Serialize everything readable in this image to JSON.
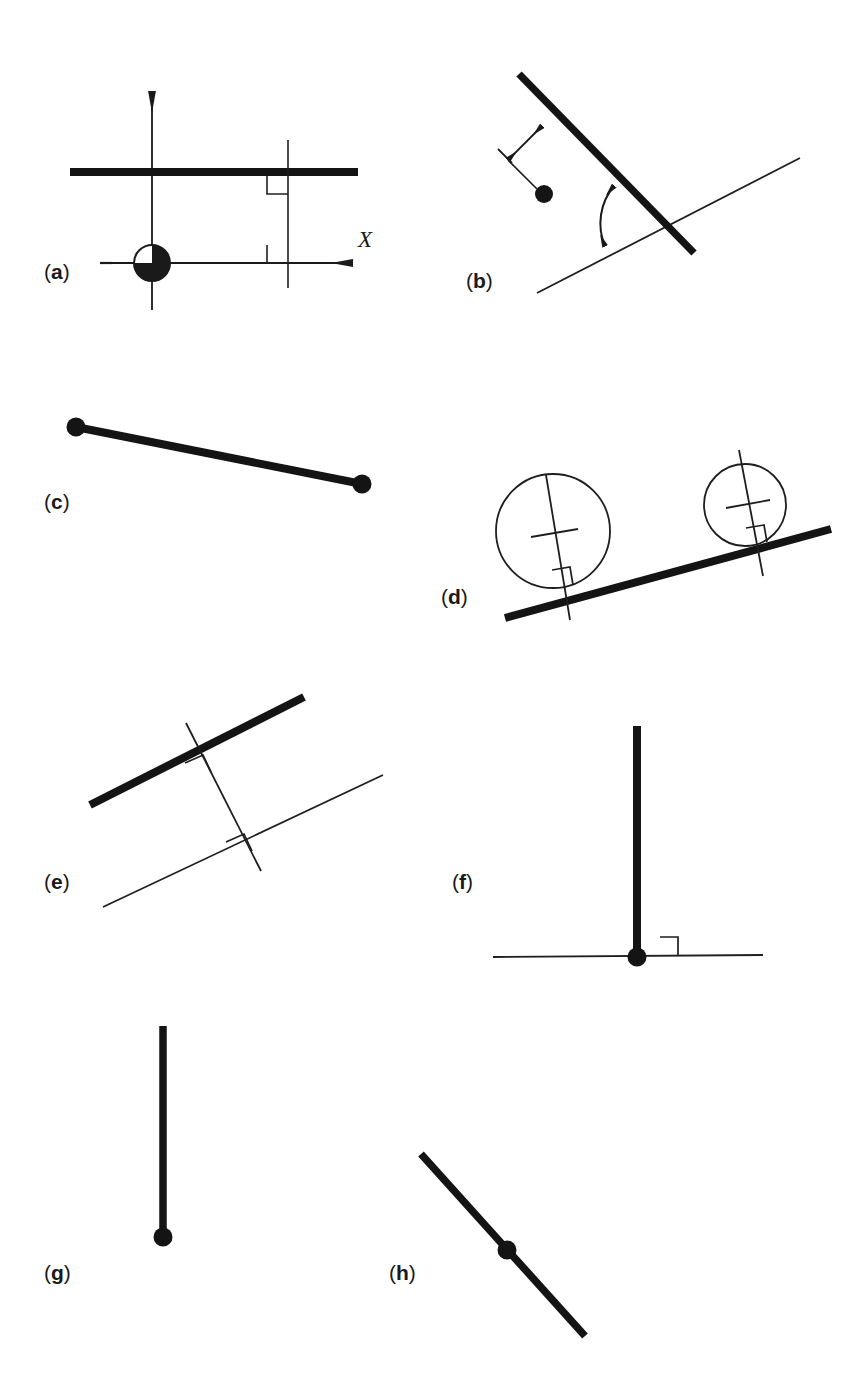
{
  "figure": {
    "background_color": "#ffffff",
    "ink_color": "#1a1a1a",
    "thick_stroke_color": "#141414",
    "thin_stroke_color": "#1f1f1f",
    "panel_count": 8
  },
  "panels": [
    {
      "id": "a",
      "label_paren_open": "(",
      "label_letter": "a",
      "label_paren_close": ")",
      "description": "Coordinate axes with origin symbol, thick horizontal bar and two right-angle markers on a vertical transversal",
      "axis_label_x": "X",
      "elements": [
        "y-axis-arrow",
        "x-axis-arrow",
        "origin-quadrant-circle",
        "thick-horizontal-bar",
        "vertical-transversal",
        "right-angle-marker-upper",
        "right-angle-marker-lower",
        "negative-tick"
      ]
    },
    {
      "id": "b",
      "label_paren_open": "(",
      "label_letter": "b",
      "label_paren_close": ")",
      "description": "Thick inclined bar crossing a thin line, perpendicular distance double-arrow to a point, and angle arc between bar and line",
      "elements": [
        "thick-inclined-bar",
        "thin-reference-line",
        "distance-double-arrow",
        "extension-tick",
        "leader-line",
        "point-dot",
        "angle-arc-double-arrow"
      ]
    },
    {
      "id": "c",
      "label_paren_open": "(",
      "label_letter": "c",
      "label_paren_close": ")",
      "description": "Thick bar with filled circular endpoints at both ends",
      "elements": [
        "thick-bar",
        "endpoint-dot-left",
        "endpoint-dot-right"
      ]
    },
    {
      "id": "d",
      "label_paren_open": "(",
      "label_letter": "d",
      "label_paren_close": ")",
      "description": "Two circles tangent to a thick inclined bar, each with a perpendicular radius line, center cross-tick and right-angle marker",
      "elements": [
        "thick-inclined-bar",
        "large-circle",
        "large-circle-radius-line",
        "large-circle-center-tick",
        "large-circle-right-angle-marker",
        "small-circle",
        "small-circle-radius-line",
        "small-circle-center-tick",
        "small-circle-right-angle-marker"
      ]
    },
    {
      "id": "e",
      "label_paren_open": "(",
      "label_letter": "e",
      "label_paren_close": ")",
      "description": "Thick bar parallel to a thin line with a perpendicular transversal and right-angle markers at both intersections",
      "elements": [
        "thick-bar",
        "thin-parallel-line",
        "perpendicular-transversal",
        "right-angle-marker-top",
        "right-angle-marker-bottom"
      ]
    },
    {
      "id": "f",
      "label_paren_open": "(",
      "label_letter": "f",
      "label_paren_close": ")",
      "description": "Thick vertical bar standing perpendicular on a thin horizontal line with a base point dot and right-angle marker",
      "elements": [
        "thick-vertical-bar",
        "thin-horizontal-line",
        "base-point-dot",
        "right-angle-marker"
      ]
    },
    {
      "id": "g",
      "label_paren_open": "(",
      "label_letter": "g",
      "label_paren_close": ")",
      "description": "Thick vertical bar with a single filled dot at its lower end",
      "elements": [
        "thick-vertical-bar",
        "endpoint-dot-bottom"
      ]
    },
    {
      "id": "h",
      "label_paren_open": "(",
      "label_letter": "h",
      "label_paren_close": ")",
      "description": "Thick diagonal bar with a filled dot at its midpoint",
      "elements": [
        "thick-diagonal-bar",
        "midpoint-dot"
      ]
    }
  ],
  "caption": {
    "text": ""
  }
}
